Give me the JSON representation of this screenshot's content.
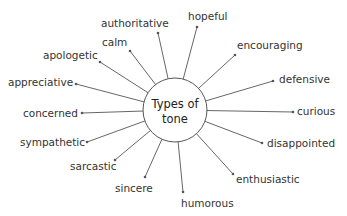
{
  "diagram": {
    "type": "spider-map",
    "center": {
      "line1": "Types of",
      "line2": "tone",
      "cx": 175,
      "cy": 110,
      "r": 32
    },
    "colors": {
      "line": "#555555",
      "text": "#333333",
      "circle_stroke": "#555555",
      "background": "#ffffff"
    },
    "nodes": [
      {
        "label": "authoritative",
        "tx": 101,
        "ty": 27,
        "anchor": "start",
        "dx": 158,
        "dy": 33
      },
      {
        "label": "hopeful",
        "tx": 188,
        "ty": 20,
        "anchor": "start",
        "dx": 197,
        "dy": 27
      },
      {
        "label": "calm",
        "tx": 102,
        "ty": 46,
        "anchor": "start",
        "dx": 130,
        "dy": 51
      },
      {
        "label": "encouraging",
        "tx": 237,
        "ty": 49,
        "anchor": "start",
        "dx": 235,
        "dy": 55
      },
      {
        "label": "apologetic",
        "tx": 43,
        "ty": 59,
        "anchor": "start",
        "dx": 100,
        "dy": 62
      },
      {
        "label": "defensive",
        "tx": 279,
        "ty": 83,
        "anchor": "start",
        "dx": 273,
        "dy": 81
      },
      {
        "label": "appreciative",
        "tx": 8,
        "ty": 86,
        "anchor": "start",
        "dx": 76,
        "dy": 84
      },
      {
        "label": "concerned",
        "tx": 23,
        "ty": 117,
        "anchor": "start",
        "dx": 82,
        "dy": 113
      },
      {
        "label": "curious",
        "tx": 297,
        "ty": 115,
        "anchor": "start",
        "dx": 293,
        "dy": 112
      },
      {
        "label": "sympathetic",
        "tx": 20,
        "ty": 146,
        "anchor": "start",
        "dx": 87,
        "dy": 142
      },
      {
        "label": "disappointed",
        "tx": 267,
        "ty": 147,
        "anchor": "start",
        "dx": 262,
        "dy": 143
      },
      {
        "label": "sarcastic",
        "tx": 70,
        "ty": 170,
        "anchor": "start",
        "dx": 115,
        "dy": 160
      },
      {
        "label": "enthusiastic",
        "tx": 236,
        "ty": 183,
        "anchor": "start",
        "dx": 233,
        "dy": 174
      },
      {
        "label": "sincere",
        "tx": 115,
        "ty": 192,
        "anchor": "start",
        "dx": 145,
        "dy": 177
      },
      {
        "label": "humorous",
        "tx": 181,
        "ty": 207,
        "anchor": "start",
        "dx": 183,
        "dy": 192
      }
    ]
  }
}
